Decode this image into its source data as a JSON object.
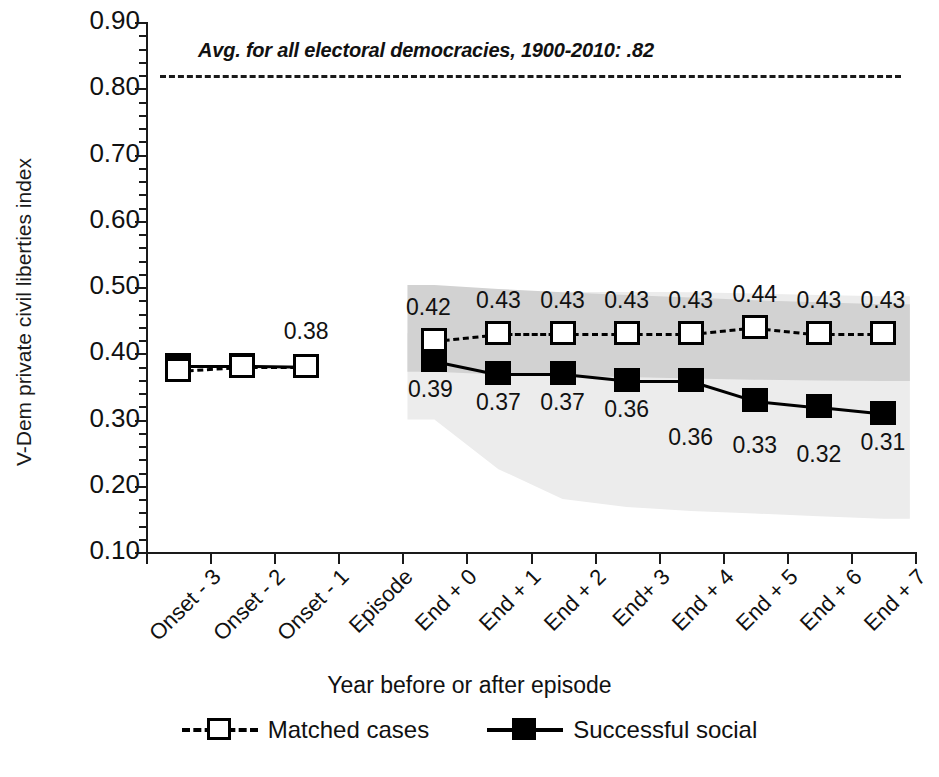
{
  "chart_data": {
    "type": "line",
    "title": "",
    "xlabel": "Year before or after episode",
    "ylabel": "V-Dem private civil liberties index",
    "ylim": [
      0.1,
      0.9
    ],
    "ytick_labels": [
      "0.90",
      "0.80",
      "0.70",
      "0.60",
      "0.50",
      "0.40",
      "0.30",
      "0.20",
      "0.10"
    ],
    "ytick_values": [
      0.9,
      0.8,
      0.7,
      0.6,
      0.5,
      0.4,
      0.3,
      0.2,
      0.1
    ],
    "minor_tick_step": 0.02,
    "grid": false,
    "legend_position": "bottom",
    "categories": [
      "Onset - 3",
      "Onset - 2",
      "Onset - 1",
      "Episode",
      "End + 0",
      "End + 1",
      "End + 2",
      "End+ 3",
      "End + 4",
      "End + 5",
      "End + 6",
      "End + 7"
    ],
    "series": [
      {
        "name": "Matched cases",
        "marker": "open-square",
        "line": "dashed",
        "values": [
          0.375,
          0.381,
          0.381,
          null,
          0.42,
          0.43,
          0.43,
          0.43,
          0.43,
          0.44,
          0.43,
          0.43
        ],
        "labels": [
          "",
          "",
          "",
          "",
          "0.42",
          "0.43",
          "0.43",
          "0.43",
          "0.43",
          "0.44",
          "0.43",
          "0.43"
        ],
        "band": {
          "name": "matched-cases-confidence-band",
          "color": "#d2d2d2",
          "upper": [
            null,
            null,
            null,
            null,
            0.503,
            0.497,
            0.492,
            0.488,
            0.484,
            0.48,
            0.477,
            0.474
          ],
          "lower": [
            null,
            null,
            null,
            null,
            0.372,
            0.368,
            0.366,
            0.364,
            0.362,
            0.36,
            0.359,
            0.358
          ]
        }
      },
      {
        "name": "Successful social",
        "marker": "filled-square",
        "line": "solid",
        "values": [
          0.382,
          0.382,
          0.381,
          null,
          0.39,
          0.37,
          0.37,
          0.36,
          0.36,
          0.33,
          0.32,
          0.31
        ],
        "labels": [
          "",
          "",
          "0.38",
          "",
          "0.39",
          "0.37",
          "0.37",
          "0.36",
          "0.36",
          "0.33",
          "0.32",
          "0.31"
        ],
        "band": {
          "name": "successful-social-confidence-band",
          "color": "#ececec",
          "upper": [
            null,
            null,
            null,
            null,
            0.43,
            0.47,
            0.492,
            0.493,
            0.492,
            0.49,
            0.488,
            0.486
          ],
          "lower": [
            null,
            null,
            null,
            null,
            0.3,
            0.225,
            0.18,
            0.168,
            0.162,
            0.158,
            0.154,
            0.15
          ]
        }
      }
    ],
    "reference_line": {
      "name": "electoral-democracies-average",
      "value": 0.82,
      "style": "dashed",
      "label": "Avg. for all electoral democracies, 1900-2010: .82"
    }
  }
}
